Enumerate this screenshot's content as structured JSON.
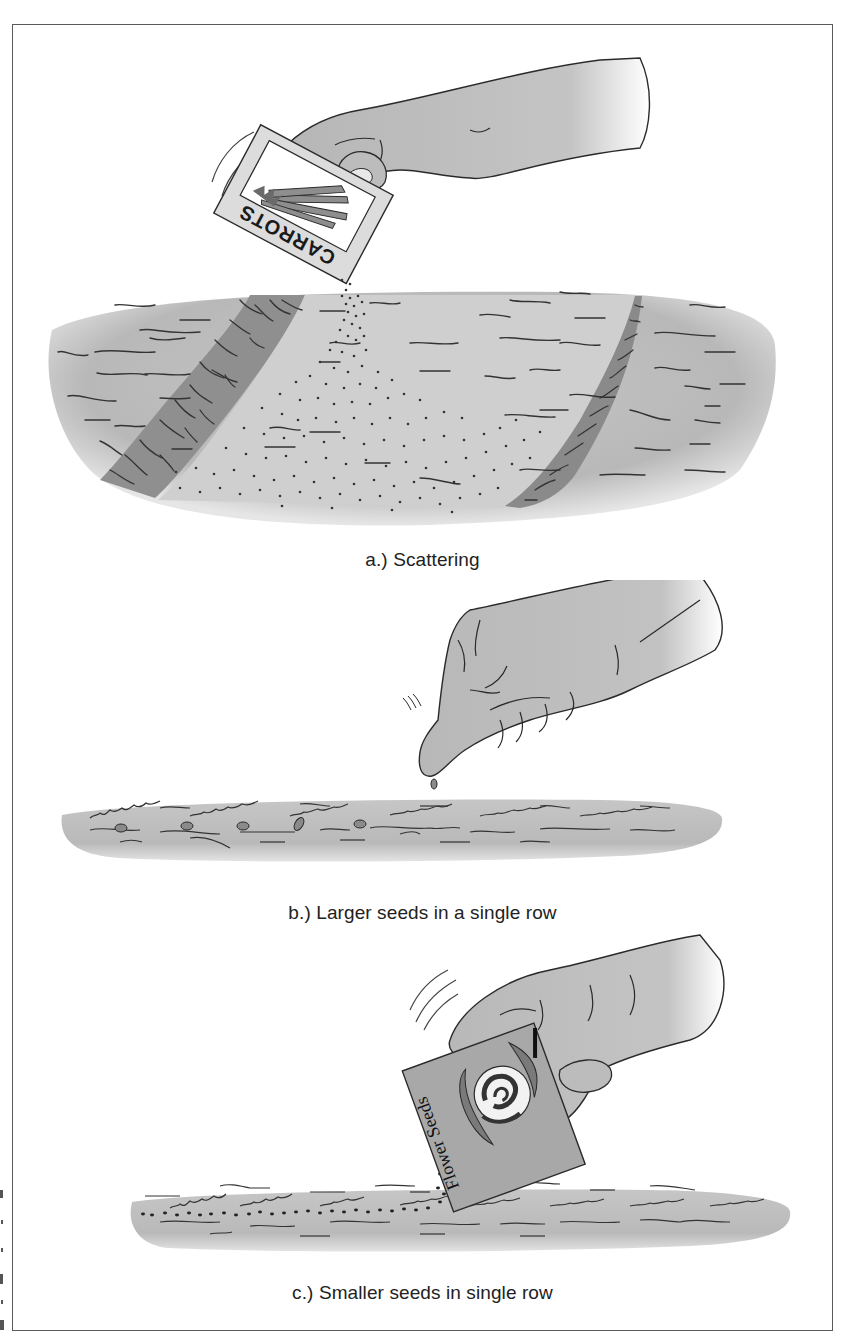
{
  "figure": {
    "panels": [
      {
        "id": "a",
        "caption": "a.) Scattering",
        "packet_label": "CARROTS",
        "method": "scattering"
      },
      {
        "id": "b",
        "caption": "b.) Larger seeds in a single row",
        "method": "single-row-large"
      },
      {
        "id": "c",
        "caption": "c.) Smaller seeds in single row",
        "packet_label": "Flower Seeds",
        "method": "single-row-small"
      }
    ]
  },
  "colors": {
    "soil_light": "#c9c9c9",
    "soil_mid": "#b3b3b3",
    "soil_dark": "#8f8f8f",
    "hand": "#bdbdbd",
    "line": "#2a2a2a",
    "frame": "#5a5a5a",
    "caption": "#222222"
  }
}
